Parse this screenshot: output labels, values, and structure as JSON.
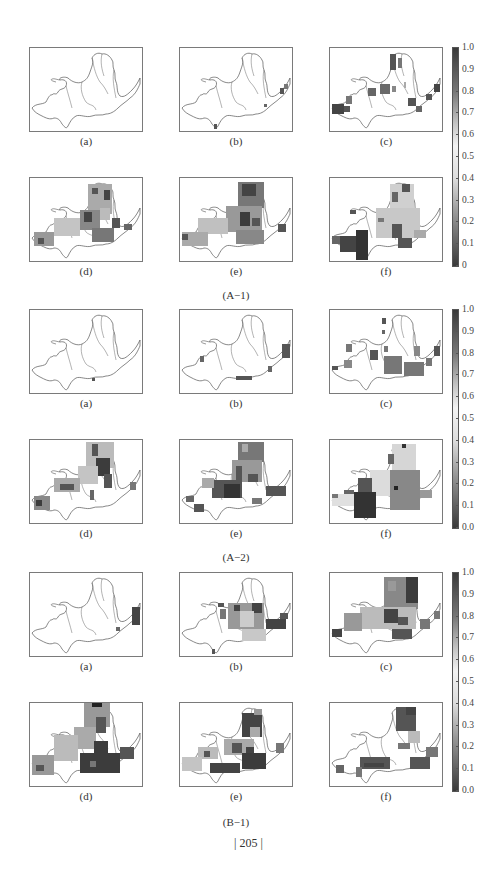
{
  "figure_groups": [
    {
      "caption": "(A−1)",
      "panels": [
        {
          "label": "(a)",
          "coverage": "none"
        },
        {
          "label": "(b)",
          "coverage": "tiny"
        },
        {
          "label": "(c)",
          "coverage": "sparse"
        },
        {
          "label": "(d)",
          "coverage": "dense"
        },
        {
          "label": "(e)",
          "coverage": "dense"
        },
        {
          "label": "(f)",
          "coverage": "dense"
        }
      ],
      "colorbar": {
        "max_label": "1.0",
        "ticks": [
          "1.0",
          "0.9",
          "0.8",
          "0.7",
          "0.6",
          "0.5",
          "0.4",
          "0.3",
          "0.2",
          "0.1",
          "0"
        ]
      }
    },
    {
      "caption": "(A−2)",
      "panels": [
        {
          "label": "(a)",
          "coverage": "none"
        },
        {
          "label": "(b)",
          "coverage": "tiny"
        },
        {
          "label": "(c)",
          "coverage": "sparse"
        },
        {
          "label": "(d)",
          "coverage": "dense"
        },
        {
          "label": "(e)",
          "coverage": "dense"
        },
        {
          "label": "(f)",
          "coverage": "dense"
        }
      ],
      "colorbar": {
        "ticks": [
          "1.0",
          "0.9",
          "0.8",
          "0.7",
          "0.6",
          "0.5",
          "0.4",
          "0.3",
          "0.2",
          "0.1",
          "0.0"
        ]
      }
    },
    {
      "caption": "(B−1)",
      "panels": [
        {
          "label": "(a)",
          "coverage": "tiny"
        },
        {
          "label": "(b)",
          "coverage": "sparse"
        },
        {
          "label": "(c)",
          "coverage": "dense"
        },
        {
          "label": "(d)",
          "coverage": "dense"
        },
        {
          "label": "(e)",
          "coverage": "dense"
        },
        {
          "label": "(f)",
          "coverage": "sparse"
        }
      ],
      "colorbar": {
        "ticks": [
          "1.0",
          "0.9",
          "0.8",
          "0.7",
          "0.6",
          "0.5",
          "0.4",
          "0.3",
          "0.2",
          "0.1",
          "0.0"
        ]
      }
    }
  ],
  "page_number": "| 205 |",
  "colors": {
    "frame": "#7a7a7a",
    "outline": "#555555",
    "colorbar_top": "#3a3a3a",
    "colorbar_mid": "#f2f2f2",
    "colorbar_bottom": "#3a3a3a"
  }
}
